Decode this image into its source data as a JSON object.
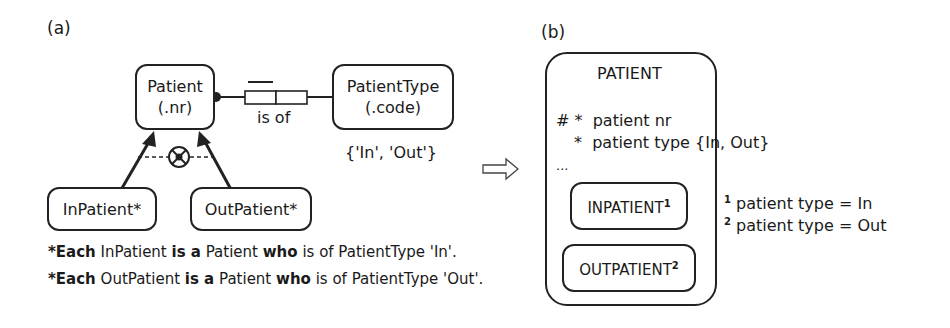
{
  "panel_a": {
    "label": "(a)",
    "entities": {
      "patient": {
        "name": "Patient",
        "ref": "(.nr)"
      },
      "patient_type": {
        "name": "PatientType",
        "ref": "(.code)"
      },
      "in_patient": {
        "name": "InPatient*"
      },
      "out_patient": {
        "name": "OutPatient*"
      }
    },
    "fact_type": {
      "reading": "is of"
    },
    "value_constraint": "{'In', 'Out'}",
    "subtype_constraint": "exclusive-or (partition)",
    "rules": [
      {
        "star": "*",
        "each": "Each",
        "subtype": "InPatient",
        "isa": "is a",
        "supertype": "Patient",
        "who": "who",
        "rest": "is of PatientType 'In'."
      },
      {
        "star": "*",
        "each": "Each",
        "subtype": "OutPatient",
        "isa": "is a",
        "supertype": "Patient",
        "who": "who",
        "rest": "is of PatientType 'Out'."
      }
    ]
  },
  "transform_arrow": "right-hollow-arrow",
  "panel_b": {
    "label": "(b)",
    "entity": {
      "name": "PATIENT",
      "attributes": [
        {
          "markers": "# *",
          "text": "patient nr"
        },
        {
          "markers": "*",
          "text": "patient type {In, Out}"
        }
      ],
      "ellipsis": "...",
      "subtypes": [
        {
          "name": "INPATIENT",
          "note": "1"
        },
        {
          "name": "OUTPATIENT",
          "note": "2"
        }
      ]
    },
    "footnotes": [
      {
        "num": "1",
        "text": "patient type = In"
      },
      {
        "num": "2",
        "text": "patient type = Out"
      }
    ]
  }
}
